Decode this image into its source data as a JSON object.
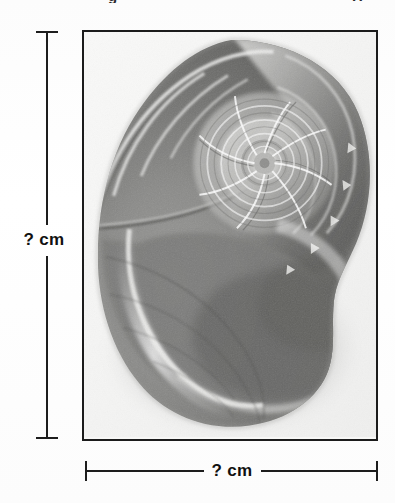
{
  "page": {
    "background_color": "#fdfdfd",
    "width": 395,
    "height": 503
  },
  "top_cut_text": {
    "left_fragment": "g",
    "right_fragment": "H"
  },
  "figure": {
    "frame_border_color": "#1b1b1b",
    "photo_background_color": "#f7f7f6",
    "spiral_center": {
      "x": 183,
      "y": 133
    }
  },
  "dimensions": {
    "line_color": "#1d1d1d",
    "height": {
      "label": "? cm",
      "orientation": "vertical",
      "position": "left"
    },
    "width": {
      "label": "? cm",
      "orientation": "horizontal",
      "position": "bottom"
    }
  }
}
